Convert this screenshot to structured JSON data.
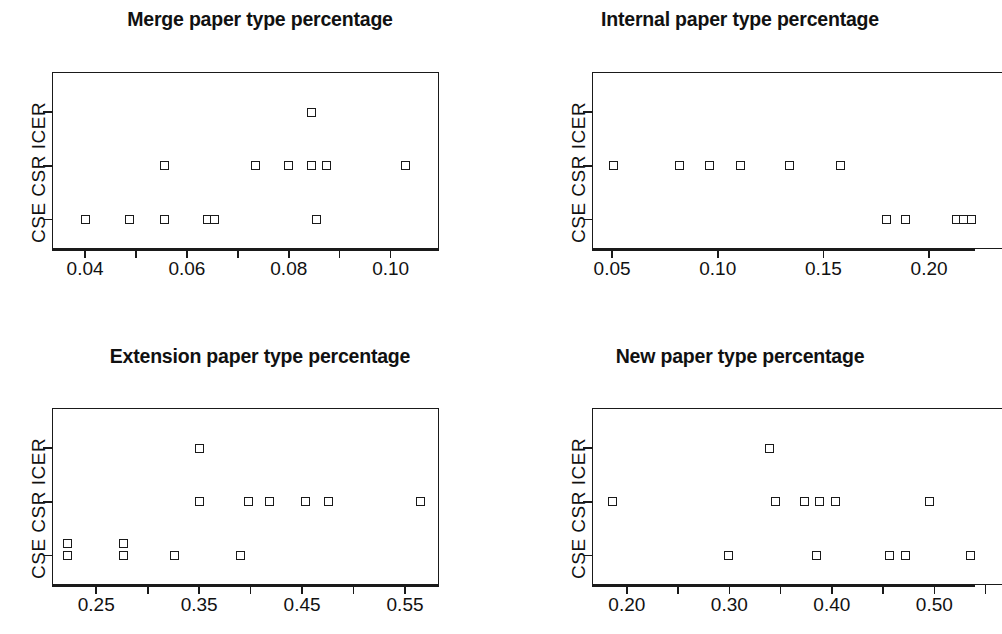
{
  "figure": {
    "layout": "2x2 grid of strip/scatter plots",
    "y_axis_label": "CSE  CSR  ICER",
    "y_categories": [
      "CSE",
      "CSR",
      "ICER"
    ],
    "marker": "open-square",
    "background": "#ffffff",
    "foreground": "#1a1a1a"
  },
  "chart_data": [
    {
      "type": "scatter",
      "title": "Merge paper type percentage",
      "xlabel": "",
      "ylabel": "CSE  CSR  ICER",
      "xlim": [
        0.0335,
        0.1095
      ],
      "xticks": [
        0.04,
        0.05,
        0.06,
        0.07,
        0.08,
        0.09,
        0.1
      ],
      "xticklabels": [
        "0.04",
        "",
        "0.06",
        "",
        "0.08",
        "",
        "0.10"
      ],
      "yticks": [
        1,
        2,
        3
      ],
      "yticklabels": [
        "CSE",
        "CSR",
        "ICER"
      ],
      "ylim": [
        0.45,
        3.75
      ],
      "grid": false,
      "legend": null,
      "points": [
        {
          "x": 0.0845,
          "y": 3
        },
        {
          "x": 0.0555,
          "y": 2
        },
        {
          "x": 0.0735,
          "y": 2
        },
        {
          "x": 0.08,
          "y": 2
        },
        {
          "x": 0.0845,
          "y": 2
        },
        {
          "x": 0.0875,
          "y": 2
        },
        {
          "x": 0.103,
          "y": 2
        },
        {
          "x": 0.04,
          "y": 1
        },
        {
          "x": 0.0487,
          "y": 1
        },
        {
          "x": 0.0555,
          "y": 1
        },
        {
          "x": 0.064,
          "y": 1
        },
        {
          "x": 0.0655,
          "y": 1
        },
        {
          "x": 0.0855,
          "y": 1
        }
      ]
    },
    {
      "type": "scatter",
      "title": "Internal paper type percentage",
      "xlabel": "",
      "ylabel": "CSE  CSR  ICER",
      "xlim": [
        0.0405,
        0.2345
      ],
      "xticks": [
        0.05,
        0.1,
        0.15,
        0.2
      ],
      "xticklabels": [
        "0.05",
        "0.10",
        "0.15",
        "0.20"
      ],
      "yticks": [
        1,
        2,
        3
      ],
      "yticklabels": [
        "CSE",
        "CSR",
        "ICER"
      ],
      "ylim": [
        0.45,
        3.75
      ],
      "grid": false,
      "legend": null,
      "note": "right portion of panel is clipped by the image edge",
      "points": [
        {
          "x": 0.2275,
          "y": 3
        },
        {
          "x": 0.0505,
          "y": 2
        },
        {
          "x": 0.082,
          "y": 2
        },
        {
          "x": 0.096,
          "y": 2
        },
        {
          "x": 0.111,
          "y": 2
        },
        {
          "x": 0.134,
          "y": 2
        },
        {
          "x": 0.158,
          "y": 2
        },
        {
          "x": 0.18,
          "y": 1
        },
        {
          "x": 0.189,
          "y": 1
        },
        {
          "x": 0.213,
          "y": 1
        },
        {
          "x": 0.2165,
          "y": 1
        },
        {
          "x": 0.22,
          "y": 1
        },
        {
          "x": 0.2235,
          "y": 1
        }
      ]
    },
    {
      "type": "scatter",
      "title": "Extension paper type percentage",
      "xlabel": "",
      "ylabel": "CSE  CSR  ICER",
      "xlim": [
        0.207,
        0.583
      ],
      "xticks": [
        0.25,
        0.3,
        0.35,
        0.4,
        0.45,
        0.5,
        0.55
      ],
      "xticklabels": [
        "0.25",
        "",
        "0.35",
        "",
        "0.45",
        "",
        "0.55"
      ],
      "yticks": [
        1,
        2,
        3
      ],
      "yticklabels": [
        "CSE",
        "CSR",
        "ICER"
      ],
      "ylim": [
        0.45,
        3.75
      ],
      "grid": false,
      "legend": null,
      "points": [
        {
          "x": 0.35,
          "y": 3
        },
        {
          "x": 0.35,
          "y": 2
        },
        {
          "x": 0.3975,
          "y": 2
        },
        {
          "x": 0.4185,
          "y": 2
        },
        {
          "x": 0.453,
          "y": 2
        },
        {
          "x": 0.476,
          "y": 2
        },
        {
          "x": 0.565,
          "y": 2
        },
        {
          "x": 0.2225,
          "y": 1
        },
        {
          "x": 0.2225,
          "y": 1.22
        },
        {
          "x": 0.276,
          "y": 1
        },
        {
          "x": 0.276,
          "y": 1.22
        },
        {
          "x": 0.3265,
          "y": 1
        },
        {
          "x": 0.39,
          "y": 1
        }
      ]
    },
    {
      "type": "scatter",
      "title": "New paper type percentage",
      "xlabel": "",
      "ylabel": "CSE  CSR  ICER",
      "xlim": [
        0.166,
        0.566
      ],
      "xticks": [
        0.2,
        0.25,
        0.3,
        0.35,
        0.4,
        0.45,
        0.5,
        0.55
      ],
      "xticklabels": [
        "0.20",
        "",
        "0.30",
        "",
        "0.40",
        "",
        "0.50",
        ""
      ],
      "yticks": [
        1,
        2,
        3
      ],
      "yticklabels": [
        "CSE",
        "CSR",
        "ICER"
      ],
      "ylim": [
        0.45,
        3.75
      ],
      "grid": false,
      "legend": null,
      "note": "right portion of panel is clipped by the image edge",
      "points": [
        {
          "x": 0.339,
          "y": 3
        },
        {
          "x": 0.186,
          "y": 2
        },
        {
          "x": 0.345,
          "y": 2
        },
        {
          "x": 0.373,
          "y": 2
        },
        {
          "x": 0.388,
          "y": 2
        },
        {
          "x": 0.404,
          "y": 2
        },
        {
          "x": 0.495,
          "y": 2
        },
        {
          "x": 0.299,
          "y": 1
        },
        {
          "x": 0.385,
          "y": 1
        },
        {
          "x": 0.456,
          "y": 1
        },
        {
          "x": 0.472,
          "y": 1
        },
        {
          "x": 0.535,
          "y": 1
        },
        {
          "x": 0.546,
          "y": 1
        }
      ]
    }
  ],
  "panels": [
    {
      "key": "merge",
      "title": "Merge paper type percentage",
      "ylabel": "CSE  CSR  ICER"
    },
    {
      "key": "internal",
      "title": "Internal paper type percentage",
      "ylabel": "CSE  CSR  ICER"
    },
    {
      "key": "extension",
      "title": "Extension paper type percentage",
      "ylabel": "CSE  CSR  ICER"
    },
    {
      "key": "new",
      "title": "New paper type percentage",
      "ylabel": "CSE  CSR  ICER"
    }
  ]
}
